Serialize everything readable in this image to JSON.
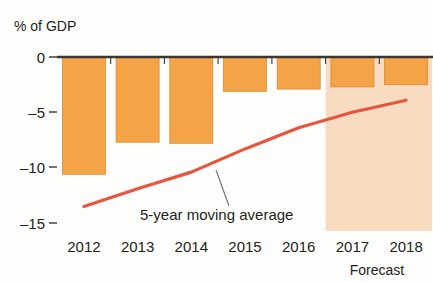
{
  "chart_data": {
    "type": "bar",
    "title": "",
    "subtitle": "",
    "ylabel": "% of GDP",
    "xlabel": "",
    "categories": [
      "2012",
      "2013",
      "2014",
      "2015",
      "2016",
      "2017",
      "2018"
    ],
    "values": [
      -10.6,
      -7.7,
      -7.8,
      -3.1,
      -2.9,
      -2.7,
      -2.5
    ],
    "series": [
      {
        "name": "Budget balance",
        "type": "bar",
        "values": [
          -10.6,
          -7.7,
          -7.8,
          -3.1,
          -2.9,
          -2.7,
          -2.5
        ]
      },
      {
        "name": "5-year moving average",
        "type": "line",
        "x": [
          "2012",
          "2013",
          "2014",
          "2015",
          "2016",
          "2017",
          "2018"
        ],
        "values": [
          -13.5,
          -11.9,
          -10.4,
          -8.3,
          -6.4,
          -5.0,
          -3.9
        ]
      }
    ],
    "ylim": [
      -15,
      0
    ],
    "yticks": [
      0,
      -5,
      -10,
      -15
    ],
    "ytick_labels": [
      "0",
      "–5",
      "–10",
      "–15"
    ],
    "grid": false,
    "legend": "none",
    "annotations": [
      {
        "text": "5-year moving average",
        "target_series": "5-year moving average"
      },
      {
        "text": "Forecast",
        "applies_to": [
          "2017",
          "2018"
        ]
      }
    ],
    "colors": {
      "bar": "#F5A347",
      "bar_edge": "#D98A33",
      "line": "#E8553F",
      "forecast_band": "#F7DCC2",
      "axis": "#3a3632",
      "text": "#231f20",
      "background": "#fdfdfb",
      "leader_line": "#6d7075"
    }
  },
  "labels": {
    "y_axis_title": "% of GDP",
    "forecast": "Forecast",
    "moving_average": "5-year moving average"
  }
}
